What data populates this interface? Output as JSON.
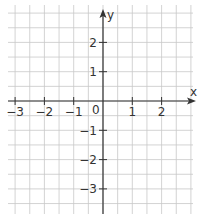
{
  "diagram": {
    "type": "coordinate-plane",
    "axes": {
      "x_label": "x",
      "y_label": "y",
      "origin_label": "0"
    },
    "x_ticks": [
      {
        "value": -3,
        "label": "−3"
      },
      {
        "value": -2,
        "label": "−2"
      },
      {
        "value": -1,
        "label": "−1"
      },
      {
        "value": 1,
        "label": "1"
      },
      {
        "value": 2,
        "label": "2"
      }
    ],
    "y_ticks": [
      {
        "value": 2,
        "label": "2"
      },
      {
        "value": 1,
        "label": "1"
      },
      {
        "value": -1,
        "label": "−1"
      },
      {
        "value": -2,
        "label": "−2"
      },
      {
        "value": -3,
        "label": "−3"
      }
    ],
    "grid_step": 0.5,
    "colors": {
      "grid": "#c8c8c8",
      "axis": "#333333",
      "background": "#ffffff"
    }
  }
}
